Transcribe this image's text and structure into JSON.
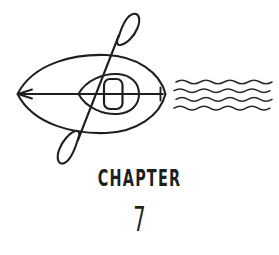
{
  "page": {
    "background_color": "#ffffff",
    "ink_color": "#1f1f1f",
    "width": 279,
    "height": 255
  },
  "heading": {
    "chapter_label": "CHAPTER",
    "chapter_number": "7"
  },
  "illustration": {
    "title": "kayak-with-paddle-and-water",
    "description": "Line drawing of a kayak seen from above with a paddle laid diagonally across it and wavy water lines to the right",
    "stroke_color": "#1f1f1f",
    "parts": [
      {
        "name": "kayak-hull",
        "label": "Kayak hull"
      },
      {
        "name": "cockpit-coaming",
        "label": "Cockpit coaming"
      },
      {
        "name": "cockpit-opening",
        "label": "Cockpit opening"
      },
      {
        "name": "keel-line",
        "label": "Keel line"
      },
      {
        "name": "bow-arrowhead",
        "label": "Bow arrowhead"
      },
      {
        "name": "stern-tick",
        "label": "Stern tick"
      },
      {
        "name": "paddle-shaft",
        "label": "Paddle shaft"
      },
      {
        "name": "paddle-blade-upper",
        "label": "Upper paddle blade"
      },
      {
        "name": "paddle-blade-lower",
        "label": "Lower paddle blade"
      },
      {
        "name": "water-waves",
        "label": "Water waves"
      }
    ],
    "water": {
      "wave_count": 4,
      "wave_color": "#2a2a2a"
    }
  }
}
